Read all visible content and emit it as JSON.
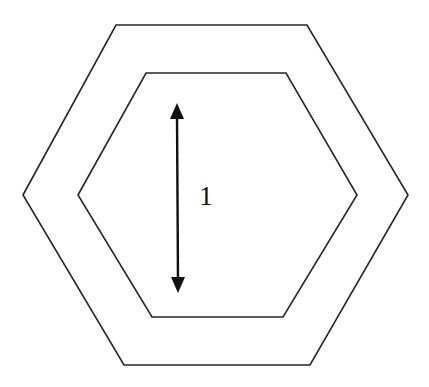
{
  "figure": {
    "kind": "geometry-diagram",
    "background_color": "#ffffff",
    "stroke_color": "#262626",
    "arrow_color": "#111111",
    "canvas": {
      "width": 429,
      "height": 387
    },
    "outer_hexagon": {
      "name": "outer-hexagon",
      "points": "23,195 116,25 307,25 408,195 310,365 124,365"
    },
    "inner_hexagon": {
      "name": "inner-hexagon",
      "points": "78,195 146,73 286,73 357,195 283,317 152,317"
    },
    "dimension": {
      "label": "1",
      "label_x": 206,
      "label_y": 196,
      "shaft_x": 177,
      "top_y": 103,
      "bottom_y": 293,
      "head_half_width": 7,
      "head_length": 15,
      "top_head_points": "177,103 170,119 184,119",
      "bottom_head_points": "178,293 171,277 185,277"
    }
  }
}
